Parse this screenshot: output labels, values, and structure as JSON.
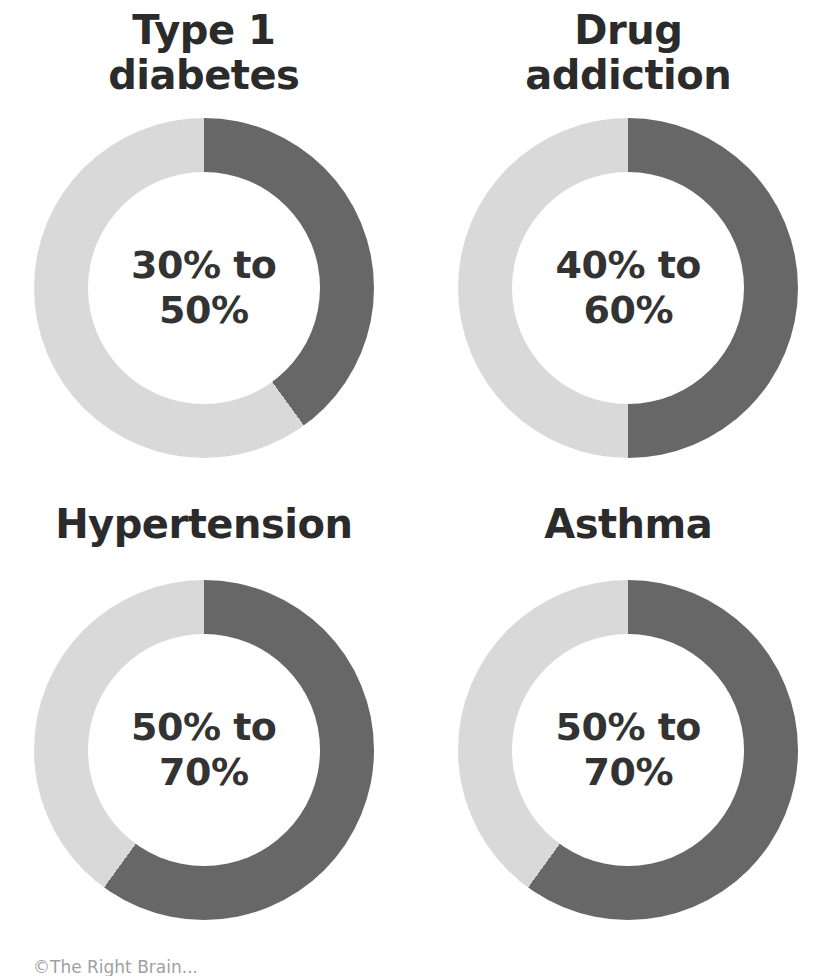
{
  "colors": {
    "background": "#ffffff",
    "dark_segment": "#676767",
    "light_segment": "#d9d9d9",
    "title_text": "#2b2b2b",
    "value_text": "#333333",
    "caption_text": "#9ca1a4"
  },
  "caption": "©The Right Brain...",
  "chart_data": [
    {
      "type": "pie",
      "variant": "donut",
      "title": "Type 1 diabetes",
      "title_lines": [
        "Type 1",
        "diabetes"
      ],
      "center_label": "30% to 50%",
      "center_label_lines": [
        "30% to",
        "50%"
      ],
      "range_low_percent": 30,
      "range_high_percent": 50,
      "dark_share_percent": 40,
      "values": [
        40,
        60
      ],
      "start_angle": "12 o'clock",
      "direction": "clockwise",
      "legend": "none"
    },
    {
      "type": "pie",
      "variant": "donut",
      "title": "Drug addiction",
      "title_lines": [
        "Drug",
        "addiction"
      ],
      "center_label": "40% to 60%",
      "center_label_lines": [
        "40% to",
        "60%"
      ],
      "range_low_percent": 40,
      "range_high_percent": 60,
      "dark_share_percent": 50,
      "values": [
        50,
        50
      ],
      "start_angle": "12 o'clock",
      "direction": "clockwise",
      "legend": "none"
    },
    {
      "type": "pie",
      "variant": "donut",
      "title": "Hypertension",
      "title_lines": [
        "Hypertension"
      ],
      "center_label": "50% to 70%",
      "center_label_lines": [
        "50% to",
        "70%"
      ],
      "range_low_percent": 50,
      "range_high_percent": 70,
      "dark_share_percent": 60,
      "values": [
        60,
        40
      ],
      "start_angle": "12 o'clock",
      "direction": "clockwise",
      "legend": "none"
    },
    {
      "type": "pie",
      "variant": "donut",
      "title": "Asthma",
      "title_lines": [
        "Asthma"
      ],
      "center_label": "50% to 70%",
      "center_label_lines": [
        "50% to",
        "70%"
      ],
      "range_low_percent": 50,
      "range_high_percent": 70,
      "dark_share_percent": 60,
      "values": [
        60,
        40
      ],
      "start_angle": "12 o'clock",
      "direction": "clockwise",
      "legend": "none"
    }
  ]
}
